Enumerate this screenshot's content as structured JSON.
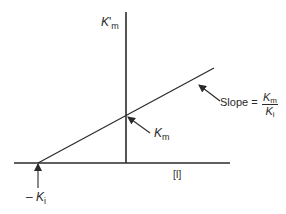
{
  "diagram": {
    "type": "secondary-plot",
    "colors": {
      "line": "#2a2a2a",
      "background": "#ffffff"
    },
    "y_axis": {
      "label_main": "K",
      "label_prime": "'",
      "label_sub": "m"
    },
    "x_axis": {
      "label": "[I]"
    },
    "intercepts": {
      "y_intercept": {
        "label_main": "K",
        "label_sub": "m"
      },
      "x_intercept": {
        "label_prefix": "– ",
        "label_main": "K",
        "label_sub": "i"
      }
    },
    "slope": {
      "prefix": "Slope = ",
      "numerator_main": "K",
      "numerator_sub": "m",
      "denominator_main": "K",
      "denominator_sub": "i"
    }
  }
}
